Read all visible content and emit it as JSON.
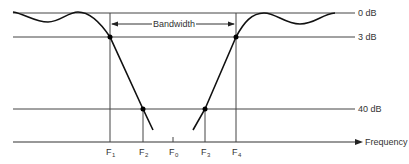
{
  "diagram": {
    "levels": [
      {
        "label": "0 dB",
        "y": 13
      },
      {
        "label": "3 dB",
        "y": 37
      },
      {
        "label": "40 dB",
        "y": 109
      }
    ],
    "axis": {
      "label": "Frequency",
      "y": 142
    },
    "bandwidth_label": "Bandwidth",
    "frequencies": [
      {
        "main": "F",
        "sub": "1",
        "x": 110
      },
      {
        "main": "F",
        "sub": "2",
        "x": 143
      },
      {
        "main": "F",
        "sub": "0",
        "x": 173
      },
      {
        "main": "F",
        "sub": "3",
        "x": 205
      },
      {
        "main": "F",
        "sub": "4",
        "x": 236
      }
    ],
    "colors": {
      "line": "#333333",
      "curve": "#111111"
    }
  }
}
